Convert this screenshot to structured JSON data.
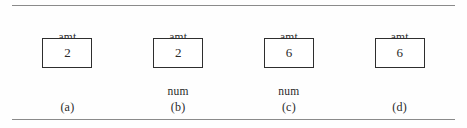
{
  "figure": {
    "background_color": "#fefefe",
    "rule_color": "#8a8a8a",
    "box_border_color": "#2e2e2e",
    "text_color": "#2a2a2a",
    "panels": [
      {
        "top_label": "amt",
        "box_value": "2",
        "bottom_label": "",
        "has_bottom_label": false,
        "caption": "(a)"
      },
      {
        "top_label": "amt",
        "box_value": "2",
        "bottom_label": "num",
        "has_bottom_label": true,
        "caption": "(b)"
      },
      {
        "top_label": "amt",
        "box_value": "6",
        "bottom_label": "num",
        "has_bottom_label": true,
        "caption": "(c)"
      },
      {
        "top_label": "amt",
        "box_value": "6",
        "bottom_label": "",
        "has_bottom_label": false,
        "caption": "(d)"
      }
    ]
  }
}
